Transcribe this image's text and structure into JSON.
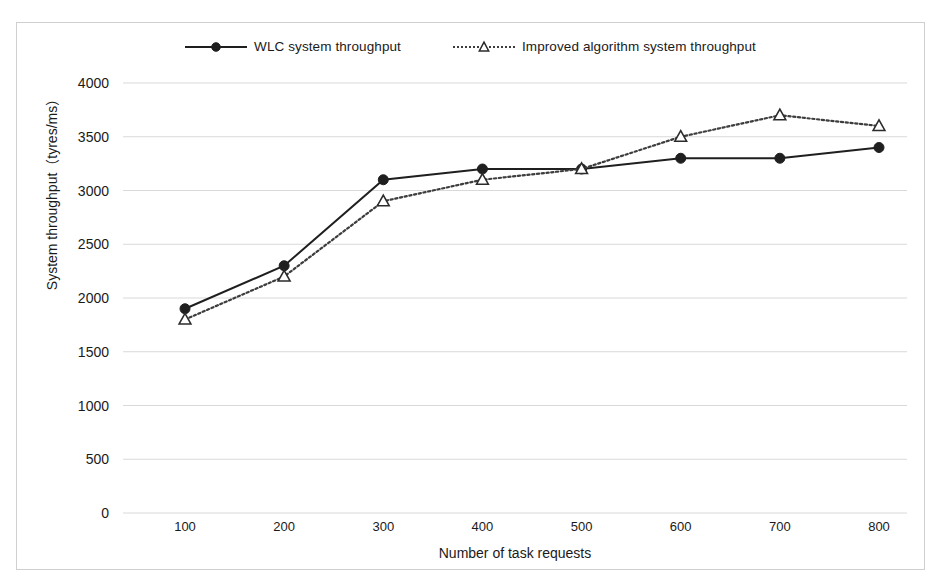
{
  "chart_data": {
    "type": "line",
    "title": "",
    "xlabel": "Number of task requests",
    "ylabel": "System throughput（tyres/ms）",
    "categories": [
      100,
      200,
      300,
      400,
      500,
      600,
      700,
      800
    ],
    "x": [
      100,
      200,
      300,
      400,
      500,
      600,
      700,
      800
    ],
    "xtick_labels": [
      "100",
      "200",
      "300",
      "400",
      "500",
      "600",
      "700",
      "800"
    ],
    "ytick_labels": [
      "0",
      "500",
      "1000",
      "1500",
      "2000",
      "2500",
      "3000",
      "3500",
      "4000"
    ],
    "yticks": [
      0,
      500,
      1000,
      1500,
      2000,
      2500,
      3000,
      3500,
      4000
    ],
    "ylim": [
      0,
      4000
    ],
    "xlim": [
      100,
      800
    ],
    "grid": "horizontal",
    "legend_position": "top-center",
    "series": [
      {
        "name": "WLC system throughput",
        "values": [
          1900,
          2300,
          3100,
          3200,
          3200,
          3300,
          3300,
          3400
        ],
        "line_style": "solid",
        "marker": "filled-circle",
        "color": "#1f1f1f"
      },
      {
        "name": "Improved algorithm system throughput",
        "values": [
          1800,
          2200,
          2900,
          3100,
          3200,
          3500,
          3700,
          3600
        ],
        "line_style": "dotted",
        "marker": "hollow-triangle",
        "color": "#3d3d3d"
      }
    ]
  },
  "legend": {
    "entries": [
      {
        "label": "WLC system throughput"
      },
      {
        "label": "Improved algorithm system throughput"
      }
    ]
  },
  "colors": {
    "series_1": "#1f1f1f",
    "series_2": "#3d3d3d",
    "gridline": "#d9d9d9",
    "frame": "#cfcfcf",
    "text": "#1a1a1a"
  }
}
